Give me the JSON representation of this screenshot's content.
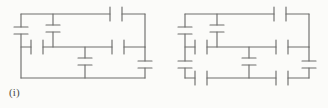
{
  "sheet": {
    "background_color": "#fbfbf9",
    "ink_color": "#6e6e6c",
    "description": "Two pencil-drawn capacitor network circuit diagrams labelled (i) and (ii)"
  },
  "figures": [
    {
      "id": "figure-i",
      "caption": "(i)",
      "diagram_type": "capacitor-network",
      "capacitor_count": 9,
      "components": [
        {
          "name": "capacitor-left-upper",
          "orientation": "vertical",
          "x": 21,
          "y": 30
        },
        {
          "name": "capacitor-branch-top-middle",
          "orientation": "vertical",
          "x": 53,
          "y": 28
        },
        {
          "name": "capacitor-top-right",
          "orientation": "horizontal",
          "x": 116,
          "y": 14
        },
        {
          "name": "capacitor-middle-left",
          "orientation": "horizontal",
          "x": 37,
          "y": 47
        },
        {
          "name": "capacitor-middle-right",
          "orientation": "horizontal",
          "x": 118,
          "y": 47
        },
        {
          "name": "capacitor-center-vertical",
          "orientation": "vertical",
          "x": 85,
          "y": 61
        },
        {
          "name": "capacitor-right-lower",
          "orientation": "vertical",
          "x": 145,
          "y": 64
        }
      ],
      "nodes": [
        {
          "name": "node-top-left",
          "x": 21,
          "y": 14
        },
        {
          "name": "node-top-branch",
          "x": 53,
          "y": 14
        },
        {
          "name": "node-top-right",
          "x": 145,
          "y": 14
        },
        {
          "name": "node-middle-left",
          "x": 21,
          "y": 47
        },
        {
          "name": "node-middle-mid",
          "x": 53,
          "y": 47
        },
        {
          "name": "node-middle-cent",
          "x": 85,
          "y": 47
        },
        {
          "name": "node-middle-right",
          "x": 145,
          "y": 47
        },
        {
          "name": "node-bottom-left",
          "x": 21,
          "y": 78
        },
        {
          "name": "node-bottom-cent",
          "x": 85,
          "y": 78
        },
        {
          "name": "node-bottom-right",
          "x": 145,
          "y": 78
        }
      ]
    },
    {
      "id": "figure-ii",
      "caption": "(ii)",
      "diagram_type": "capacitor-network",
      "capacitor_count": 13,
      "components": [
        {
          "name": "capacitor-left-upper",
          "orientation": "vertical",
          "x": 21,
          "y": 30
        },
        {
          "name": "capacitor-left-lower",
          "orientation": "vertical",
          "x": 21,
          "y": 64
        },
        {
          "name": "capacitor-branch-top-middle",
          "orientation": "vertical",
          "x": 53,
          "y": 28
        },
        {
          "name": "capacitor-top-right",
          "orientation": "horizontal",
          "x": 116,
          "y": 14
        },
        {
          "name": "capacitor-middle-left",
          "orientation": "horizontal",
          "x": 37,
          "y": 47
        },
        {
          "name": "capacitor-middle-right",
          "orientation": "horizontal",
          "x": 118,
          "y": 47
        },
        {
          "name": "capacitor-center-vertical",
          "orientation": "vertical",
          "x": 85,
          "y": 61
        },
        {
          "name": "capacitor-right-lower",
          "orientation": "vertical",
          "x": 145,
          "y": 64
        },
        {
          "name": "capacitor-bottom-left",
          "orientation": "horizontal",
          "x": 37,
          "y": 78
        },
        {
          "name": "capacitor-bottom-right",
          "orientation": "horizontal",
          "x": 118,
          "y": 78
        }
      ],
      "nodes": [
        {
          "name": "node-top-left",
          "x": 21,
          "y": 14
        },
        {
          "name": "node-top-branch",
          "x": 53,
          "y": 14
        },
        {
          "name": "node-top-right",
          "x": 145,
          "y": 14
        },
        {
          "name": "node-middle-left",
          "x": 21,
          "y": 47
        },
        {
          "name": "node-middle-mid",
          "x": 53,
          "y": 47
        },
        {
          "name": "node-middle-cent",
          "x": 85,
          "y": 47
        },
        {
          "name": "node-middle-right",
          "x": 145,
          "y": 47
        },
        {
          "name": "node-bottom-left",
          "x": 21,
          "y": 78
        },
        {
          "name": "node-bottom-cent",
          "x": 85,
          "y": 78
        },
        {
          "name": "node-bottom-right",
          "x": 145,
          "y": 78
        }
      ]
    }
  ]
}
